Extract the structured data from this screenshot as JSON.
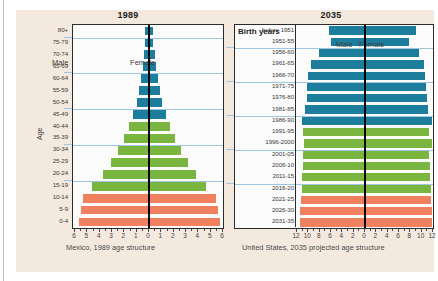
{
  "chart_data": [
    {
      "type": "bar",
      "title": "1989",
      "caption": "Mexico, 1989 age structure",
      "ylabel": "Age",
      "xlabel": "",
      "orientation": "population-pyramid",
      "legend": [
        "Male",
        "Female"
      ],
      "xlim": [
        -6,
        6
      ],
      "xticks": [
        "6",
        "5",
        "4",
        "3",
        "2",
        "1",
        "0",
        "1",
        "2",
        "3",
        "4",
        "5",
        "6"
      ],
      "gridlines_at": [
        "75-79",
        "60-64",
        "45-49",
        "30-34",
        "15-19"
      ],
      "categories": [
        "80+",
        "75-79",
        "70-74",
        "65-69",
        "60-64",
        "55-59",
        "50-54",
        "45-49",
        "40-44",
        "35-39",
        "30-34",
        "25-29",
        "20-24",
        "15-19",
        "10-14",
        "5-9",
        "0-4"
      ],
      "colors": {
        "older": "#1c7e9c",
        "middle": "#7ab63f",
        "young": "#f0805e"
      },
      "color_by_category": [
        "older",
        "older",
        "older",
        "older",
        "older",
        "older",
        "older",
        "older",
        "middle",
        "middle",
        "middle",
        "middle",
        "middle",
        "middle",
        "young",
        "young",
        "young"
      ],
      "series": [
        {
          "name": "Male",
          "values": [
            0.32,
            0.34,
            0.42,
            0.52,
            0.66,
            0.82,
            1.0,
            1.3,
            1.65,
            2.05,
            2.55,
            3.1,
            3.75,
            4.6,
            5.35,
            5.55,
            5.7
          ]
        },
        {
          "name": "Female",
          "values": [
            0.34,
            0.36,
            0.45,
            0.55,
            0.7,
            0.86,
            1.05,
            1.35,
            1.7,
            2.1,
            2.6,
            3.15,
            3.8,
            4.65,
            5.4,
            5.6,
            5.75
          ]
        }
      ]
    },
    {
      "type": "bar",
      "title": "2035",
      "caption": "United States, 2035 projected age structure",
      "ylabel": "Birth years",
      "xlabel": "",
      "orientation": "population-pyramid",
      "legend": [
        "Male",
        "Female"
      ],
      "xlim": [
        -12,
        12
      ],
      "xticks": [
        "12",
        "10",
        "8",
        "6",
        "4",
        "2",
        "0",
        "2",
        "4",
        "6",
        "8",
        "10",
        "12"
      ],
      "gridlines_at": [
        "1956-60",
        "1971-75",
        "1986-90",
        "2001-05",
        "2016-20"
      ],
      "categories": [
        "before 1951",
        "1951-55",
        "1956-60",
        "1961-65",
        "1966-70",
        "1971-75",
        "1976-80",
        "1981-85",
        "1986-90",
        "1991-95",
        "1996-2000",
        "2001-05",
        "2006-10",
        "2011-15",
        "2016-20",
        "2021-25",
        "2026-30",
        "2031-35"
      ],
      "colors": {
        "older": "#1c7e9c",
        "middle": "#7ab63f",
        "young": "#f0805e"
      },
      "color_by_category": [
        "older",
        "older",
        "older",
        "older",
        "older",
        "older",
        "older",
        "older",
        "older",
        "middle",
        "middle",
        "middle",
        "middle",
        "middle",
        "middle",
        "young",
        "young",
        "young"
      ],
      "series": [
        {
          "name": "Male",
          "values": [
            6.4,
            6.0,
            8.2,
            9.6,
            10.0,
            10.2,
            10.3,
            10.6,
            11.2,
            11.0,
            10.8,
            10.9,
            11.0,
            11.1,
            11.2,
            11.3,
            11.4,
            11.5
          ]
        },
        {
          "name": "Female",
          "values": [
            9.0,
            7.8,
            9.5,
            10.4,
            10.6,
            10.8,
            10.9,
            11.2,
            11.8,
            11.3,
            11.9,
            11.3,
            11.4,
            11.5,
            11.6,
            11.7,
            11.8,
            11.9
          ]
        }
      ]
    }
  ]
}
